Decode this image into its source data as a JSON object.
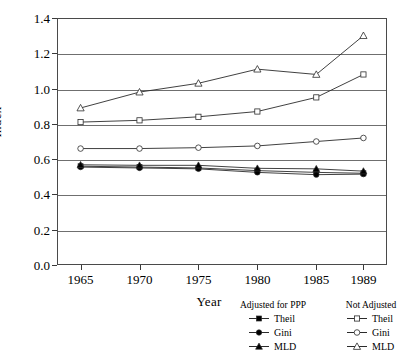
{
  "chart_data": {
    "type": "line",
    "title": "",
    "xlabel": "Year",
    "ylabel": "Index",
    "categories": [
      "1965",
      "1970",
      "1975",
      "1980",
      "1985",
      "1989"
    ],
    "x": [
      1965,
      1970,
      1975,
      1980,
      1985,
      1989
    ],
    "xlim": [
      1963,
      1991
    ],
    "ylim": [
      0.0,
      1.4
    ],
    "yticks": [
      "0.0",
      "0.2",
      "0.4",
      "0.6",
      "0.8",
      "1.0",
      "1.2",
      "1.4"
    ],
    "ytick_values": [
      0.0,
      0.2,
      0.4,
      0.6,
      0.8,
      1.0,
      1.2,
      1.4
    ],
    "grid": "horizontal",
    "legend_position": "below-right",
    "series": [
      {
        "name": "Theil",
        "group": "Adjusted for PPP",
        "marker": "filled-square",
        "values": [
          0.56,
          0.555,
          0.55,
          0.535,
          0.525,
          0.52
        ]
      },
      {
        "name": "Gini",
        "group": "Adjusted for PPP",
        "marker": "filled-circle",
        "values": [
          0.555,
          0.55,
          0.545,
          0.525,
          0.512,
          0.515
        ]
      },
      {
        "name": "MLD",
        "group": "Adjusted for PPP",
        "marker": "filled-triangle",
        "values": [
          0.568,
          0.565,
          0.565,
          0.548,
          0.545,
          0.532
        ]
      },
      {
        "name": "Theil",
        "group": "Not Adjusted",
        "marker": "open-square",
        "values": [
          0.81,
          0.82,
          0.84,
          0.87,
          0.95,
          1.08
        ]
      },
      {
        "name": "Gini",
        "group": "Not Adjusted",
        "marker": "open-circle",
        "values": [
          0.66,
          0.66,
          0.665,
          0.675,
          0.7,
          0.72
        ]
      },
      {
        "name": "MLD",
        "group": "Not Adjusted",
        "marker": "open-triangle",
        "values": [
          0.89,
          0.98,
          1.03,
          1.11,
          1.08,
          1.3
        ]
      }
    ]
  },
  "axes": {
    "ylabel": "Index",
    "xlabel": "Year",
    "yticks": [
      "0.0",
      "0.2",
      "0.4",
      "0.6",
      "0.8",
      "1.0",
      "1.2",
      "1.4"
    ],
    "xticks": [
      "1965",
      "1970",
      "1975",
      "1980",
      "1985",
      "1989"
    ]
  },
  "legend": {
    "header_left": "Adjusted for PPP",
    "header_right": "Not Adjusted",
    "rows": [
      {
        "left_label": "Theil",
        "right_label": "Theil"
      },
      {
        "left_label": "Gini",
        "right_label": "Gini"
      },
      {
        "left_label": "MLD",
        "right_label": "MLD"
      }
    ]
  },
  "colors": {
    "line": "#2b2b2b",
    "grid": "#6f6f6f",
    "frame": "#4a4a4a",
    "marker_fill_solid": "#000000",
    "marker_fill_open": "#ffffff"
  }
}
